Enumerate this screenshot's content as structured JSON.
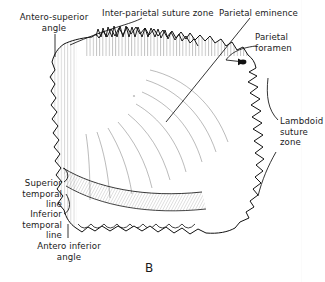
{
  "figure": {
    "letter": "B",
    "ink_color": "#1a1a1a",
    "background_color": "#ffffff"
  },
  "labels": [
    {
      "id": "antero-superior-angle",
      "text": "Antero-superior\nangle",
      "align": "center",
      "x": 8,
      "y": 12,
      "width": 92
    },
    {
      "id": "inter-parietal-suture-zone",
      "text": "Inter-parietal suture zone",
      "align": "left",
      "x": 102,
      "y": 8,
      "width": 120
    },
    {
      "id": "parietal-eminence",
      "text": "Parietal eminence",
      "align": "left",
      "x": 219,
      "y": 8,
      "width": 90
    },
    {
      "id": "parietal-foramen",
      "text": "Parietal\nforamen",
      "align": "left",
      "x": 255,
      "y": 32,
      "width": 60
    },
    {
      "id": "lambdoid-suture-zone",
      "text": "Lambdoid\nsuture\nzone",
      "align": "left",
      "x": 280,
      "y": 116,
      "width": 46
    },
    {
      "id": "superior-temporal-line",
      "text": "Superior\ntemporal\nline",
      "align": "right",
      "x": 6,
      "y": 178,
      "width": 56
    },
    {
      "id": "inferior-temporal-line",
      "text": "Inferior\ntemporal\nline",
      "align": "right",
      "x": 6,
      "y": 209,
      "width": 56
    },
    {
      "id": "antero-inferior-angle",
      "text": "Antero inferior\nangle",
      "align": "center",
      "x": 22,
      "y": 241,
      "width": 94
    }
  ]
}
